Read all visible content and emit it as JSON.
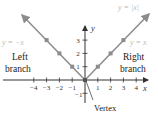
{
  "diagram": {
    "function_label": "y = |x|",
    "left_equation": "y = −x",
    "right_equation": "y = x",
    "left_branch_label": [
      "Left",
      "branch"
    ],
    "right_branch_label": [
      "Right",
      "branch"
    ],
    "vertex_label": "Vertex",
    "x_axis_label": "x",
    "y_axis_label": "y",
    "x_ticks": [
      "−4",
      "−3",
      "−2",
      "−1",
      "1",
      "2",
      "3",
      "4"
    ],
    "x_tick_values": [
      -4,
      -3,
      -2,
      -1,
      1,
      2,
      3,
      4
    ],
    "y_ticks": [
      "1",
      "2",
      "3"
    ],
    "y_tick_values": [
      1,
      2,
      3
    ],
    "y_neg_tick": "−1",
    "points": [
      [
        -3,
        3
      ],
      [
        -2,
        2
      ],
      [
        -1,
        1
      ],
      [
        0,
        0
      ],
      [
        1,
        1
      ],
      [
        2,
        2
      ],
      [
        3,
        3
      ]
    ],
    "colors": {
      "line": "#8c8c8c",
      "point": "#8c8c8c",
      "axis": "#333333",
      "equation_text": "#bbbbbb"
    }
  }
}
